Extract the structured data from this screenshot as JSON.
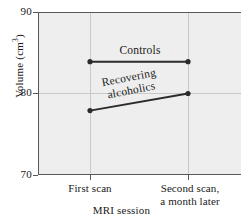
{
  "chart_data": {
    "type": "line",
    "title": "",
    "xlabel": "MRI session",
    "ylabel": "Volume (cm3)",
    "ylabel_text": "Volume (cm",
    "ylabel_sup": "3",
    "ylabel_close": ")",
    "categories": [
      "First scan",
      "Second scan,\na month later"
    ],
    "x_tick_labels": [
      "First scan",
      "Second scan,\na month later"
    ],
    "y_tick_labels": [
      "90",
      "80",
      "70"
    ],
    "ylim": [
      70,
      90
    ],
    "y_ticks": [
      70,
      80,
      90
    ],
    "grid": true,
    "grid_style": "light vertical lines at each category and horizontal line at 80",
    "legend": "inline labels next to each line",
    "series": [
      {
        "name": "Controls",
        "label": "Controls",
        "values": [
          83.9,
          83.9
        ],
        "color": "#2b2b2b"
      },
      {
        "name": "Recovering alcoholics",
        "label": "Recovering\nalcoholics",
        "values": [
          77.9,
          80.0
        ],
        "color": "#2b2b2b"
      }
    ]
  },
  "figure": {
    "plot_background": "#eeeeee",
    "axis_color": "#58585a",
    "page_background": "#ffffff"
  }
}
